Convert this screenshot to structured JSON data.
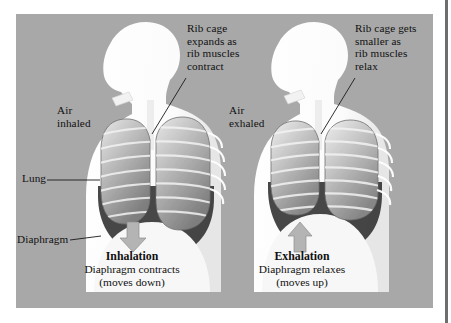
{
  "figure": {
    "background_color": "#a8a8a8",
    "page_color": "#ffffff",
    "text_color": "#101010"
  },
  "callouts": {
    "inhalation_ribcage": "Rib cage\nexpands as\nrib muscles\ncontract",
    "exhalation_ribcage": "Rib cage gets\nsmaller as\nrib muscles\nrelax"
  },
  "airflow": {
    "inhaled": "Air\ninhaled",
    "exhaled": "Air\nexhaled"
  },
  "anatomy_labels": {
    "lung": "Lung",
    "diaphragm": "Diaphragm"
  },
  "captions": {
    "left": {
      "title": "Inhalation",
      "line1": "Diaphragm contracts",
      "line2": "(moves down)",
      "arrow_direction": "down"
    },
    "right": {
      "title": "Exhalation",
      "line1": "Diaphragm relaxes",
      "line2": "(moves up)",
      "arrow_direction": "up"
    }
  }
}
